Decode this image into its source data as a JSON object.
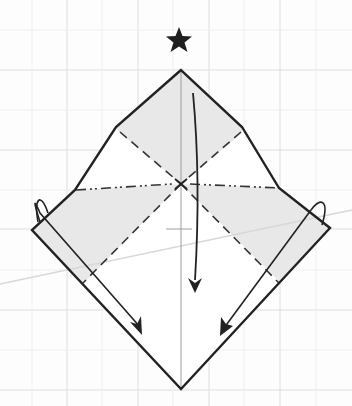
{
  "diagram": {
    "type": "origami-fold-step",
    "colors": {
      "background": "#fdfdfd",
      "grid": "#dcdcdc",
      "paper_shaded": "#e8e8e8",
      "paper_white": "#ffffff",
      "outline": "#222222",
      "crease": "#333333",
      "guide_line": "#d8d8d8"
    },
    "symbols": {
      "star": "reference-star",
      "center_mark": "x-mark"
    },
    "fold_lines": {
      "valley": [
        "upper-left diagonal",
        "upper-right diagonal",
        "lower-left diagonal",
        "lower-right diagonal"
      ],
      "mountain": [
        "horizontal left",
        "horizontal right"
      ]
    },
    "arrows": [
      "center arrow down",
      "left corner fold-down arrow",
      "right corner fold-down arrow"
    ]
  }
}
